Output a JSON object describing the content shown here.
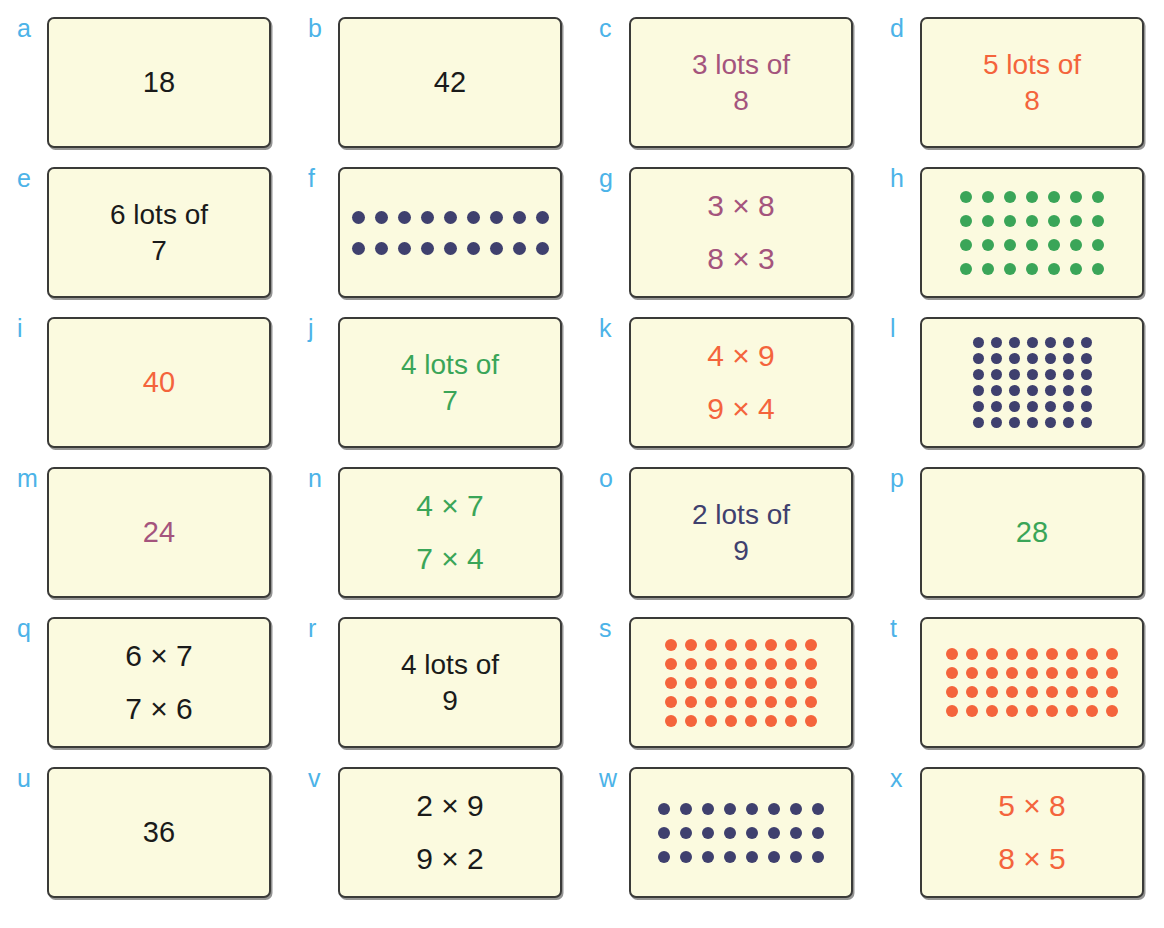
{
  "page": {
    "title_mark": "",
    "background": "#ffffff",
    "card_fill": "#fbfadf",
    "card_border": "#3a3a38",
    "label_color": "#4cb3e8"
  },
  "colors": {
    "black": "#1a1a1a",
    "purple": "#a4547d",
    "orange": "#f4643c",
    "green": "#3aa558",
    "navy": "#3f406e"
  },
  "cards": [
    {
      "label": "a",
      "kind": "text",
      "text": "18",
      "color": "#1a1a1a",
      "style": "t-single",
      "meaning": "product-18"
    },
    {
      "label": "b",
      "kind": "text",
      "text": "42",
      "color": "#1a1a1a",
      "style": "t-single",
      "meaning": "product-42"
    },
    {
      "label": "c",
      "kind": "text",
      "text": "3 lots of\n8",
      "color": "#a4547d",
      "style": "t-lots",
      "meaning": "3-lots-of-8"
    },
    {
      "label": "d",
      "kind": "text",
      "text": "5 lots of\n8",
      "color": "#f4643c",
      "style": "t-lots",
      "meaning": "5-lots-of-8"
    },
    {
      "label": "e",
      "kind": "text",
      "text": "6 lots of\n7",
      "color": "#1a1a1a",
      "style": "t-lots",
      "meaning": "6-lots-of-7"
    },
    {
      "label": "f",
      "kind": "dots",
      "rows": 2,
      "cols": 9,
      "total": 18,
      "color": "#3f406e",
      "density": "d-sparse",
      "meaning": "array-2-by-9"
    },
    {
      "label": "g",
      "kind": "text",
      "text": "3 × 8\n8 × 3",
      "color": "#a4547d",
      "style": "t-mult",
      "meaning": "3x8-and-8x3"
    },
    {
      "label": "h",
      "kind": "dots",
      "rows": 4,
      "cols": 7,
      "total": 28,
      "color": "#3aa558",
      "density": "d-medium",
      "meaning": "array-4-by-7"
    },
    {
      "label": "i",
      "kind": "text",
      "text": "40",
      "color": "#f4643c",
      "style": "t-single",
      "meaning": "product-40"
    },
    {
      "label": "j",
      "kind": "text",
      "text": "4 lots of\n7",
      "color": "#3aa558",
      "style": "t-lots",
      "meaning": "4-lots-of-7"
    },
    {
      "label": "k",
      "kind": "text",
      "text": "4 × 9\n9 × 4",
      "color": "#f4643c",
      "style": "t-mult",
      "meaning": "4x9-and-9x4"
    },
    {
      "label": "l",
      "kind": "dots",
      "rows": 6,
      "cols": 7,
      "total": 42,
      "color": "#3f406e",
      "density": "d-tight",
      "meaning": "array-6-by-7"
    },
    {
      "label": "m",
      "kind": "text",
      "text": "24",
      "color": "#a4547d",
      "style": "t-single",
      "meaning": "product-24"
    },
    {
      "label": "n",
      "kind": "text",
      "text": "4 × 7\n7 × 4",
      "color": "#3aa558",
      "style": "t-mult",
      "meaning": "4x7-and-7x4"
    },
    {
      "label": "o",
      "kind": "text",
      "text": "2 lots of\n9",
      "color": "#3f406e",
      "style": "t-lots",
      "meaning": "2-lots-of-9"
    },
    {
      "label": "p",
      "kind": "text",
      "text": "28",
      "color": "#3aa558",
      "style": "t-single",
      "meaning": "product-28"
    },
    {
      "label": "q",
      "kind": "text",
      "text": "6 × 7\n7 × 6",
      "color": "#1a1a1a",
      "style": "t-mult",
      "meaning": "6x7-and-7x6"
    },
    {
      "label": "r",
      "kind": "text",
      "text": "4 lots of\n9",
      "color": "#1a1a1a",
      "style": "t-lots",
      "meaning": "4-lots-of-9"
    },
    {
      "label": "s",
      "kind": "dots",
      "rows": 5,
      "cols": 8,
      "total": 40,
      "color": "#f4643c",
      "density": "d-dense",
      "meaning": "array-5-by-8"
    },
    {
      "label": "t",
      "kind": "dots",
      "rows": 4,
      "cols": 9,
      "total": 36,
      "color": "#f4643c",
      "density": "d-dense",
      "meaning": "array-4-by-9"
    },
    {
      "label": "u",
      "kind": "text",
      "text": "36",
      "color": "#1a1a1a",
      "style": "t-single",
      "meaning": "product-36"
    },
    {
      "label": "v",
      "kind": "text",
      "text": "2 × 9\n9 × 2",
      "color": "#1a1a1a",
      "style": "t-mult",
      "meaning": "2x9-and-9x2"
    },
    {
      "label": "w",
      "kind": "dots",
      "rows": 3,
      "cols": 8,
      "total": 24,
      "color": "#3f406e",
      "density": "d-medium",
      "meaning": "array-3-by-8"
    },
    {
      "label": "x",
      "kind": "text",
      "text": "5 × 8\n8 × 5",
      "color": "#f4643c",
      "style": "t-mult",
      "meaning": "5x8-and-8x5"
    }
  ]
}
